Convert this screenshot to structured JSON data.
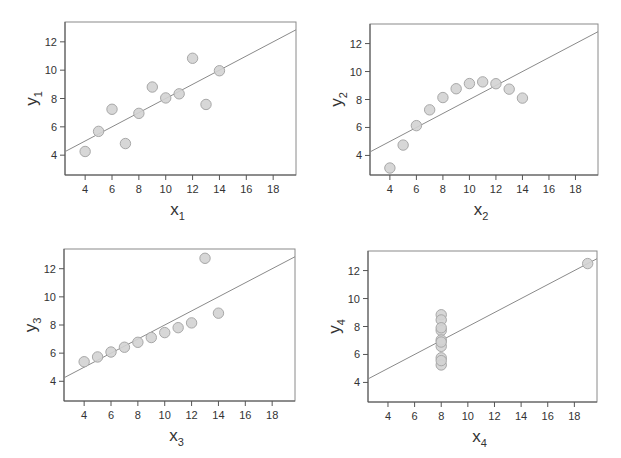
{
  "chart_data": [
    {
      "type": "scatter",
      "title": "",
      "xlabel": "x1",
      "ylabel": "y1",
      "xlabel_main": "x",
      "xlabel_sub": "1",
      "ylabel_main": "y",
      "ylabel_sub": "1",
      "xlim": [
        2.5,
        19.7
      ],
      "ylim": [
        2.6,
        13.4
      ],
      "xticks": [
        4,
        6,
        8,
        10,
        12,
        14,
        16,
        18
      ],
      "yticks": [
        4,
        6,
        8,
        10,
        12
      ],
      "grid": false,
      "x": [
        4,
        5,
        6,
        7,
        8,
        9,
        10,
        11,
        12,
        13,
        14
      ],
      "y": [
        4.26,
        5.68,
        7.24,
        4.82,
        6.95,
        8.81,
        8.04,
        8.33,
        10.84,
        7.58,
        9.96
      ],
      "fit_line": {
        "intercept": 3.0,
        "slope": 0.5
      }
    },
    {
      "type": "scatter",
      "title": "",
      "xlabel": "x2",
      "ylabel": "y2",
      "xlabel_main": "x",
      "xlabel_sub": "2",
      "ylabel_main": "y",
      "ylabel_sub": "2",
      "xlim": [
        2.5,
        19.7
      ],
      "ylim": [
        2.6,
        13.4
      ],
      "xticks": [
        4,
        6,
        8,
        10,
        12,
        14,
        16,
        18
      ],
      "yticks": [
        4,
        6,
        8,
        10,
        12
      ],
      "grid": false,
      "x": [
        4,
        5,
        6,
        7,
        8,
        9,
        10,
        11,
        12,
        13,
        14
      ],
      "y": [
        3.1,
        4.74,
        6.13,
        7.26,
        8.14,
        8.77,
        9.14,
        9.26,
        9.13,
        8.74,
        8.1
      ],
      "fit_line": {
        "intercept": 3.0,
        "slope": 0.5
      }
    },
    {
      "type": "scatter",
      "title": "",
      "xlabel": "x3",
      "ylabel": "y3",
      "xlabel_main": "x",
      "xlabel_sub": "3",
      "ylabel_main": "y",
      "ylabel_sub": "3",
      "xlim": [
        2.5,
        19.7
      ],
      "ylim": [
        2.6,
        13.4
      ],
      "xticks": [
        4,
        6,
        8,
        10,
        12,
        14,
        16,
        18
      ],
      "yticks": [
        4,
        6,
        8,
        10,
        12
      ],
      "grid": false,
      "x": [
        4,
        5,
        6,
        7,
        8,
        9,
        10,
        11,
        12,
        13,
        14
      ],
      "y": [
        5.39,
        5.73,
        6.08,
        6.42,
        6.77,
        7.11,
        7.46,
        7.81,
        8.15,
        12.74,
        8.84
      ],
      "fit_line": {
        "intercept": 3.0,
        "slope": 0.5
      }
    },
    {
      "type": "scatter",
      "title": "",
      "xlabel": "x4",
      "ylabel": "y4",
      "xlabel_main": "x",
      "xlabel_sub": "4",
      "ylabel_main": "y",
      "ylabel_sub": "4",
      "xlim": [
        2.5,
        19.7
      ],
      "ylim": [
        2.6,
        13.4
      ],
      "xticks": [
        4,
        6,
        8,
        10,
        12,
        14,
        16,
        18
      ],
      "yticks": [
        4,
        6,
        8,
        10,
        12
      ],
      "grid": false,
      "x": [
        8,
        8,
        8,
        8,
        8,
        8,
        8,
        8,
        8,
        8,
        19
      ],
      "y": [
        6.58,
        5.76,
        7.71,
        8.84,
        8.47,
        7.04,
        5.25,
        5.56,
        7.91,
        6.89,
        12.5
      ],
      "fit_line": {
        "intercept": 3.0,
        "slope": 0.5
      }
    }
  ],
  "style": {
    "point_fill": "#d3d3d3",
    "point_stroke": "#a8a8a8",
    "line_color": "#8a8a8a",
    "axis_color": "#555555",
    "frame_color": "#8a8a8a"
  },
  "layout": {
    "panels": [
      {
        "left": 65,
        "top": 22,
        "right": 296,
        "bottom": 175
      },
      {
        "left": 370,
        "top": 24,
        "right": 598,
        "bottom": 175
      },
      {
        "left": 64,
        "top": 249,
        "right": 295,
        "bottom": 401
      },
      {
        "left": 368,
        "top": 251,
        "right": 597,
        "bottom": 402
      }
    ]
  }
}
